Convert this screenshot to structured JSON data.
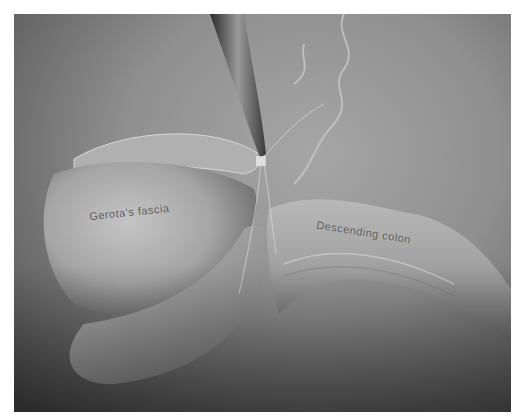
{
  "illustration": {
    "description": "Grayscale surgical illustration: instrument dissecting tissue between Gerota's fascia and descending colon",
    "labels": {
      "gerota": "Gerota's fascia",
      "colon": "Descending colon"
    },
    "colors": {
      "background": "#ffffff",
      "tissue_light": "#bdbdbd",
      "tissue_mid": "#8f8f8f",
      "tissue_dark": "#4a4a4a",
      "label_text": "#5a5a5a"
    }
  }
}
